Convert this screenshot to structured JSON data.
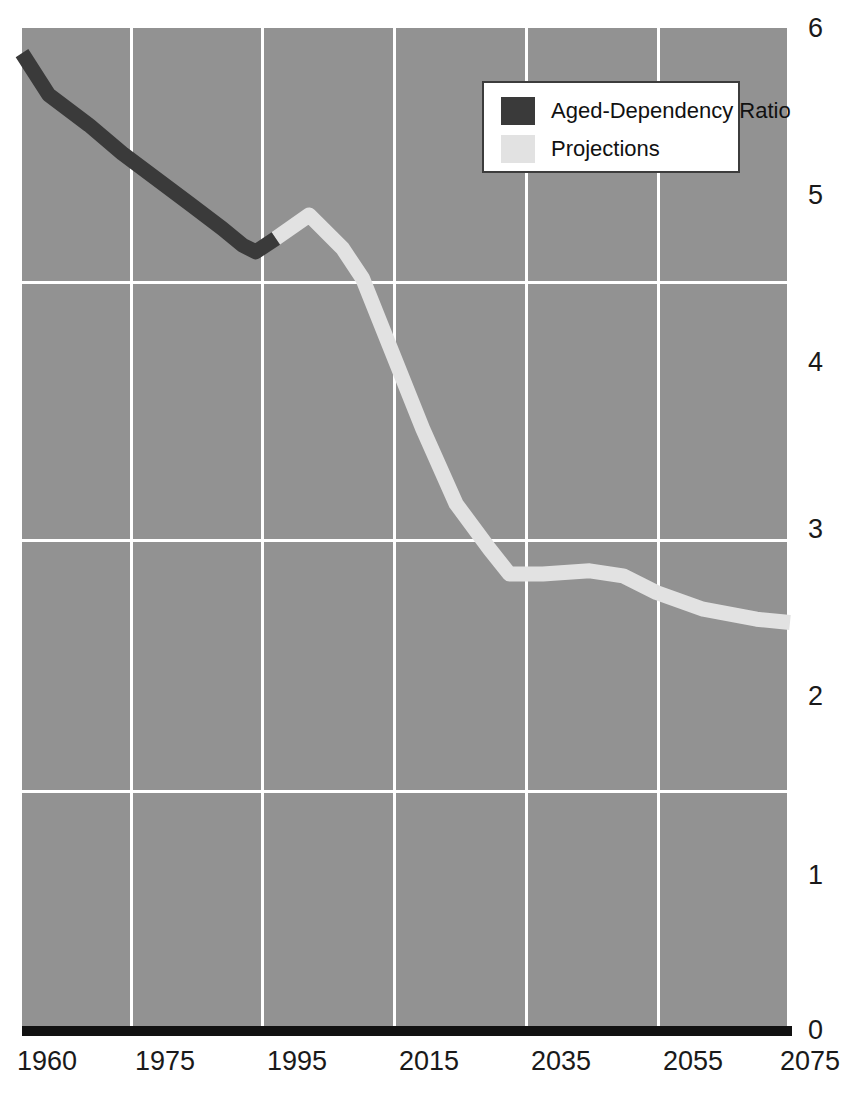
{
  "chart_data": {
    "type": "line",
    "title": "",
    "subtitle": "",
    "xlabel": "",
    "ylabel": "",
    "xlim": [
      1960,
      2075
    ],
    "ylim": [
      0,
      6
    ],
    "grid": true,
    "legend_position": "top-center-right",
    "x_ticks": [
      "1960",
      "1975",
      "1995",
      "2015",
      "2035",
      "2055",
      "2075"
    ],
    "y_ticks": [
      "0",
      "1",
      "2",
      "3",
      "4",
      "5",
      "6"
    ],
    "legend": [
      {
        "label": "Aged-Dependency Ratio",
        "color": "#3a3a3a"
      },
      {
        "label": "Projections",
        "color": "#e2e2e2"
      }
    ],
    "series": [
      {
        "name": "Aged-Dependency Ratio",
        "color": "#3a3a3a",
        "x": [
          1960,
          1964,
          1970,
          1975,
          1980,
          1985,
          1990,
          1993,
          1995,
          1998
        ],
        "values": [
          5.85,
          5.6,
          5.42,
          5.25,
          5.1,
          4.95,
          4.8,
          4.7,
          4.66,
          4.74
        ]
      },
      {
        "name": "Projections",
        "color": "#e2e2e2",
        "x": [
          1998,
          2003,
          2008,
          2011,
          2015,
          2020,
          2025,
          2030,
          2033,
          2038,
          2045,
          2050,
          2055,
          2062,
          2070,
          2075
        ],
        "values": [
          4.74,
          4.88,
          4.68,
          4.5,
          4.1,
          3.6,
          3.15,
          2.88,
          2.73,
          2.73,
          2.75,
          2.72,
          2.62,
          2.52,
          2.46,
          2.44
        ]
      }
    ]
  },
  "colors": {
    "plot_background": "#929292",
    "gridline": "#ffffff",
    "axis_rule": "#111111",
    "historical": "#3a3a3a",
    "projection": "#e2e2e2",
    "legend_background": "#ffffff",
    "legend_border": "#3c3c3c",
    "tick_text": "#1a1a1a"
  }
}
